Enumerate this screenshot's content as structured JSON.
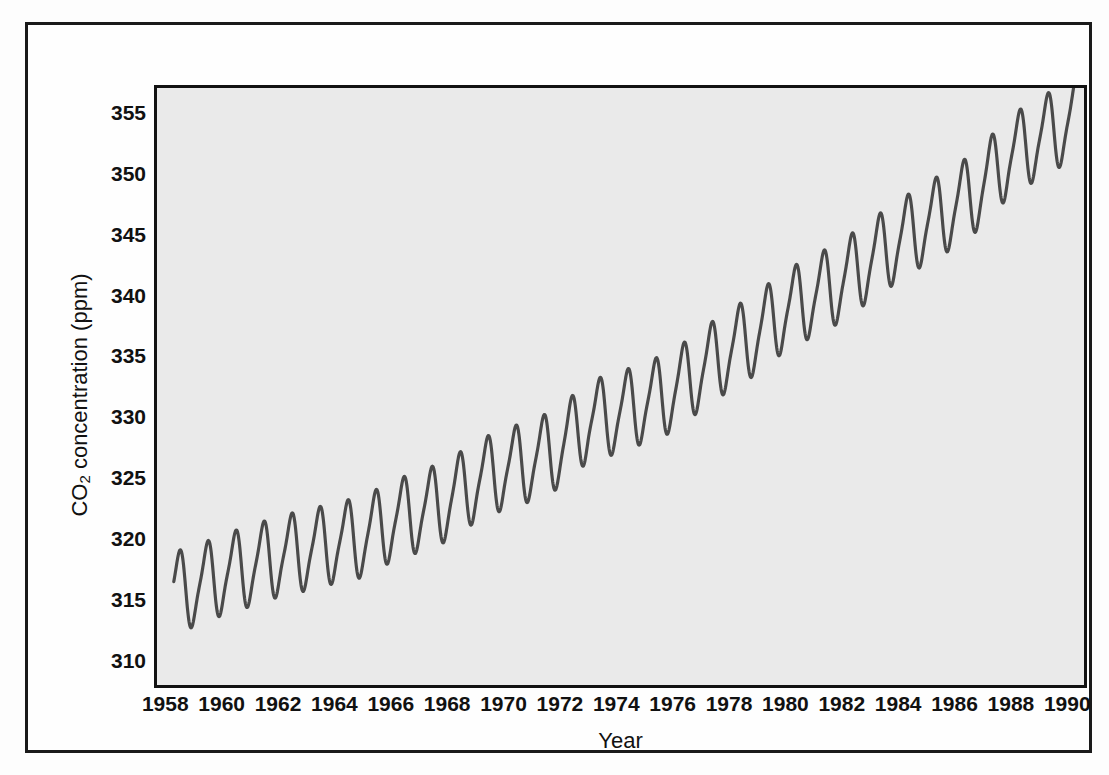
{
  "figure": {
    "top_margin_artifact": "",
    "background_color": "#fdfdfd",
    "frame_color": "#1a1a1a",
    "plot_fill_color": "#eaeaea",
    "curve_color": "#4a4a4a"
  },
  "axes": {
    "x_title": "Year",
    "y_title_prefix": "CO",
    "y_title_sub": "2",
    "y_title_suffix": " concentration (ppm)",
    "x_ticks": [
      1958,
      1960,
      1962,
      1964,
      1966,
      1968,
      1970,
      1972,
      1974,
      1976,
      1978,
      1980,
      1982,
      1984,
      1986,
      1988,
      1990
    ],
    "y_ticks": [
      355,
      350,
      345,
      340,
      335,
      330,
      325,
      320,
      315,
      310
    ]
  },
  "chart_data": {
    "type": "line",
    "title": "",
    "xlabel": "Year",
    "ylabel": "CO2 concentration (ppm)",
    "xlim": [
      1957.6,
      1990.7
    ],
    "ylim": [
      307.7,
      357.2
    ],
    "grid": false,
    "legend": null,
    "x_tick_labels": [
      "1958",
      "1960",
      "1962",
      "1964",
      "1966",
      "1968",
      "1970",
      "1972",
      "1974",
      "1976",
      "1978",
      "1980",
      "1982",
      "1984",
      "1986",
      "1988",
      "1990"
    ],
    "y_tick_labels": [
      "310",
      "315",
      "320",
      "325",
      "330",
      "335",
      "340",
      "345",
      "350",
      "355"
    ],
    "series": [
      {
        "name": "Monthly mean atmospheric CO2 (Mauna Loa)",
        "annual_mean": [
          {
            "year": 1958,
            "value": 315.3
          },
          {
            "year": 1959,
            "value": 315.9
          },
          {
            "year": 1960,
            "value": 316.9
          },
          {
            "year": 1961,
            "value": 317.6
          },
          {
            "year": 1962,
            "value": 318.4
          },
          {
            "year": 1963,
            "value": 318.9
          },
          {
            "year": 1964,
            "value": 319.5
          },
          {
            "year": 1965,
            "value": 320.0
          },
          {
            "year": 1966,
            "value": 321.3
          },
          {
            "year": 1967,
            "value": 322.1
          },
          {
            "year": 1968,
            "value": 323.0
          },
          {
            "year": 1969,
            "value": 324.6
          },
          {
            "year": 1970,
            "value": 325.6
          },
          {
            "year": 1971,
            "value": 326.3
          },
          {
            "year": 1972,
            "value": 327.4
          },
          {
            "year": 1973,
            "value": 329.6
          },
          {
            "year": 1974,
            "value": 330.2
          },
          {
            "year": 1975,
            "value": 331.1
          },
          {
            "year": 1976,
            "value": 332.0
          },
          {
            "year": 1977,
            "value": 333.8
          },
          {
            "year": 1978,
            "value": 335.4
          },
          {
            "year": 1979,
            "value": 336.8
          },
          {
            "year": 1980,
            "value": 338.7
          },
          {
            "year": 1981,
            "value": 339.9
          },
          {
            "year": 1982,
            "value": 341.1
          },
          {
            "year": 1983,
            "value": 342.8
          },
          {
            "year": 1984,
            "value": 344.4
          },
          {
            "year": 1985,
            "value": 345.9
          },
          {
            "year": 1986,
            "value": 347.2
          },
          {
            "year": 1987,
            "value": 348.9
          },
          {
            "year": 1988,
            "value": 351.5
          },
          {
            "year": 1989,
            "value": 352.9
          },
          {
            "year": 1990,
            "value": 354.2
          }
        ],
        "seasonal_amplitude_ppm": 6.2,
        "seasonal_peak_month": 5,
        "seasonal_trough_month": 10,
        "start_x": 1958.2,
        "end_x": 1990.4,
        "notes": "Sawtooth seasonal cycle superimposed on a rising trend; first plotted value near 316 ppm, final value near 353 ppm."
      }
    ]
  }
}
